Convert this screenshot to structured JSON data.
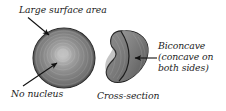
{
  "figure": {
    "background_color": "#ffffff",
    "text_color": "#1b1b1b"
  },
  "labels": {
    "large_surface_area": "Large surface area",
    "no_nucleus": "No nucleus",
    "cross_section": "Cross-section",
    "biconcave_line1": "Biconcave",
    "biconcave_line2": "(concave on",
    "biconcave_line3": "both sides)"
  },
  "shapes": {
    "round_cell": {
      "name": "red-blood-cell-face-view",
      "center_x": 64,
      "center_y": 58,
      "radius_x": 31,
      "radius_y": 30,
      "fill_outer": "#6e6e6e",
      "fill_inner": "#a9a9a9",
      "highlight": "#c2c2c2",
      "stroke": "#2a2a2a"
    },
    "cross_section": {
      "name": "red-blood-cell-cross-section",
      "fill_dark": "#6a6a6a",
      "fill_light": "#8f8f8f",
      "stroke": "#222222"
    }
  },
  "arrows": {
    "surface_area_arrow": {
      "from_x": 28,
      "from_y": 17,
      "to_x": 50,
      "to_y": 35,
      "color": "#111111"
    },
    "nucleus_arrow": {
      "from_x": 24,
      "from_y": 86,
      "to_x": 58,
      "to_y": 62,
      "color": "#111111"
    },
    "biconcave_arrow": {
      "from_x": 157,
      "from_y": 58,
      "to_x": 134,
      "to_y": 58,
      "color": "#111111"
    }
  },
  "colors": {
    "ink": "#1b1b1b",
    "cell_mid": "#8b8b8b",
    "cell_edge": "#5f5f5f",
    "outline": "#222222"
  }
}
